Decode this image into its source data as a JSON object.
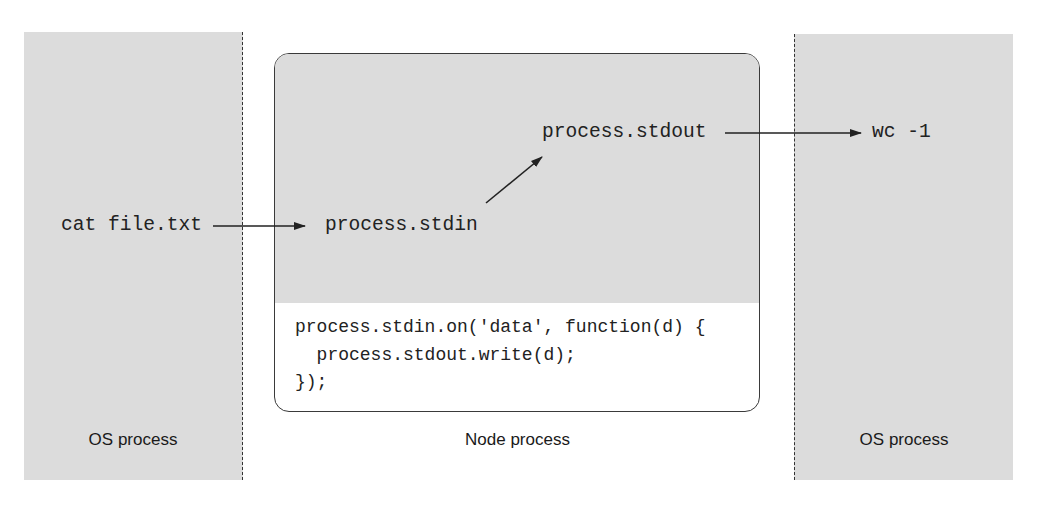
{
  "left_process": {
    "label": "OS process",
    "command": "cat file.txt"
  },
  "node_process": {
    "label": "Node process",
    "stdin": "process.stdin",
    "stdout": "process.stdout",
    "code_lines": [
      "process.stdin.on('data', function(d) {",
      "  process.stdout.write(d);",
      "});"
    ]
  },
  "right_process": {
    "label": "OS process",
    "command": "wc -1"
  },
  "colors": {
    "panel_fill": "#dcdcdc",
    "stroke": "#222222",
    "background": "#ffffff"
  }
}
